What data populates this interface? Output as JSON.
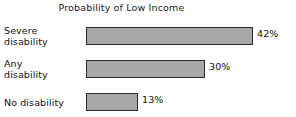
{
  "chart_data": {
    "type": "bar",
    "orientation": "horizontal",
    "title": "Probability of Low Income",
    "xlabel": "",
    "ylabel": "",
    "categories": [
      "Severe disability",
      "Any disability",
      "No disability"
    ],
    "category_lines": [
      [
        "Severe",
        "disability"
      ],
      [
        "Any",
        "disability"
      ],
      [
        "No disability"
      ]
    ],
    "values": [
      42,
      30,
      13
    ],
    "value_labels": [
      "42%",
      "30%",
      "13%"
    ],
    "xlim": [
      0,
      42
    ],
    "grid": false,
    "legend": null,
    "bar_fill_color": "#a8a8a8",
    "bar_border_color": "#2b2b2b",
    "text_color": "#111111",
    "background_color": "#ffffff",
    "px_per_unit": 3.97
  }
}
